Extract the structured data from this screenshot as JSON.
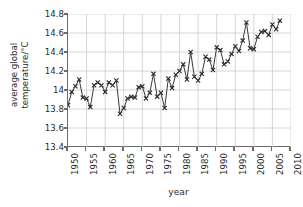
{
  "chart_data": {
    "type": "line",
    "title": "",
    "subtitle": "",
    "xlabel": "year",
    "ylabel": "average global temperature/°C",
    "ylabel_line1": "average global",
    "ylabel_line2": "temperature/°C",
    "xlim": [
      1950,
      2010
    ],
    "ylim": [
      13.4,
      14.8
    ],
    "grid": true,
    "grid_color": "#c9ccd2",
    "legend": "none",
    "marker": "x",
    "line_color": "#3a3a3a",
    "marker_color": "#2b2b2b",
    "axis_color": "#6a6a6a",
    "xticks": [
      1950,
      1955,
      1960,
      1965,
      1970,
      1975,
      1980,
      1985,
      1990,
      1995,
      2000,
      2005,
      2010
    ],
    "xticklabels": [
      "1950",
      "1955",
      "1960",
      "1965",
      "1970",
      "1975",
      "1980",
      "1985",
      "1990",
      "1995",
      "2000",
      "2005",
      "2010"
    ],
    "yticks": [
      13.4,
      13.6,
      13.8,
      14.0,
      14.2,
      14.4,
      14.6,
      14.8
    ],
    "yticklabels": [
      "13.4",
      "13.6",
      "13.8",
      "14",
      "14.2",
      "14.4",
      "14.6",
      "14.8"
    ],
    "x": [
      1950,
      1951,
      1952,
      1953,
      1954,
      1955,
      1956,
      1957,
      1958,
      1959,
      1960,
      1961,
      1962,
      1963,
      1964,
      1965,
      1966,
      1967,
      1968,
      1969,
      1970,
      1971,
      1972,
      1973,
      1974,
      1975,
      1976,
      1977,
      1978,
      1979,
      1980,
      1981,
      1982,
      1983,
      1984,
      1985,
      1986,
      1987,
      1988,
      1989,
      1990,
      1991,
      1992,
      1993,
      1994,
      1995,
      1996,
      1997,
      1998,
      1999,
      2000,
      2001,
      2002,
      2003,
      2004,
      2005,
      2006,
      2007
    ],
    "y": [
      13.84,
      13.98,
      14.04,
      14.11,
      13.92,
      13.91,
      13.82,
      14.05,
      14.08,
      14.05,
      13.98,
      14.08,
      14.05,
      14.1,
      13.75,
      13.81,
      13.91,
      13.93,
      13.92,
      14.03,
      14.04,
      13.91,
      13.97,
      14.17,
      13.93,
      13.97,
      13.81,
      14.12,
      14.02,
      14.16,
      14.2,
      14.27,
      14.11,
      14.4,
      14.14,
      14.1,
      14.17,
      14.35,
      14.32,
      14.21,
      14.45,
      14.42,
      14.27,
      14.3,
      14.38,
      14.46,
      14.41,
      14.52,
      14.71,
      14.44,
      14.43,
      14.56,
      14.61,
      14.62,
      14.58,
      14.69,
      14.64,
      14.73
    ]
  }
}
